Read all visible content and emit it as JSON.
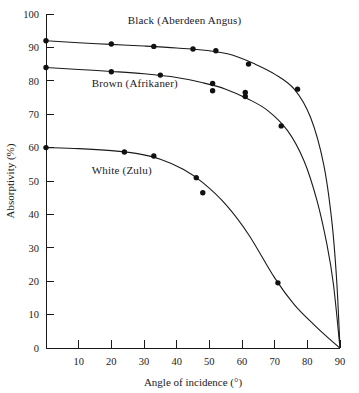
{
  "chart_data": {
    "type": "line",
    "title": "",
    "xlabel": "Angle of incidence (°)",
    "ylabel": "Absorptivity (%)",
    "xlim": [
      0,
      90
    ],
    "ylim": [
      0,
      100
    ],
    "xticks": [
      10,
      20,
      30,
      40,
      50,
      60,
      70,
      80,
      90
    ],
    "yticks": [
      0,
      10,
      20,
      30,
      40,
      50,
      60,
      70,
      80,
      90,
      100
    ],
    "xtick_labels": [
      "10",
      "20",
      "30",
      "40",
      "50",
      "60",
      "70",
      "80",
      "90"
    ],
    "ytick_labels": [
      "0",
      "10",
      "20",
      "30",
      "40",
      "50",
      "60",
      "70",
      "80",
      "90",
      "100"
    ],
    "grid": false,
    "legend_position": "inline-annotations",
    "series": [
      {
        "name": "Black (Aberdeen Angus)",
        "label": "Black (Aberdeen Angus)",
        "color": "#1a1a1a",
        "label_x": 25,
        "label_y": 97,
        "points": [
          {
            "x": 0,
            "y": 92
          },
          {
            "x": 20,
            "y": 91
          },
          {
            "x": 33,
            "y": 90.3
          },
          {
            "x": 45,
            "y": 89.5
          },
          {
            "x": 52,
            "y": 89
          },
          {
            "x": 62,
            "y": 85
          },
          {
            "x": 77,
            "y": 77.5
          }
        ],
        "curve": [
          {
            "x": 0,
            "y": 92
          },
          {
            "x": 10,
            "y": 91.4
          },
          {
            "x": 20,
            "y": 90.9
          },
          {
            "x": 30,
            "y": 90.4
          },
          {
            "x": 40,
            "y": 89.8
          },
          {
            "x": 50,
            "y": 89
          },
          {
            "x": 57,
            "y": 87.7
          },
          {
            "x": 64,
            "y": 85
          },
          {
            "x": 70,
            "y": 82
          },
          {
            "x": 76,
            "y": 77.5
          },
          {
            "x": 81,
            "y": 69
          },
          {
            "x": 85,
            "y": 55
          },
          {
            "x": 87.5,
            "y": 38
          },
          {
            "x": 89,
            "y": 20
          },
          {
            "x": 90,
            "y": 0
          }
        ]
      },
      {
        "name": "Brown (Afrikaner)",
        "label": "Brown (Afrikaner)",
        "color": "#1a1a1a",
        "label_x": 14,
        "label_y": 78,
        "points": [
          {
            "x": 0,
            "y": 84
          },
          {
            "x": 20,
            "y": 82.7
          },
          {
            "x": 35,
            "y": 81.7
          },
          {
            "x": 51,
            "y": 79.2
          },
          {
            "x": 51,
            "y": 77
          },
          {
            "x": 61,
            "y": 76.5
          },
          {
            "x": 61,
            "y": 75.3
          },
          {
            "x": 72,
            "y": 66.5
          }
        ],
        "curve": [
          {
            "x": 0,
            "y": 84
          },
          {
            "x": 10,
            "y": 83.4
          },
          {
            "x": 20,
            "y": 82.8
          },
          {
            "x": 30,
            "y": 82.1
          },
          {
            "x": 40,
            "y": 81
          },
          {
            "x": 48,
            "y": 79.4
          },
          {
            "x": 55,
            "y": 77.5
          },
          {
            "x": 62,
            "y": 74.5
          },
          {
            "x": 68,
            "y": 71
          },
          {
            "x": 74,
            "y": 65
          },
          {
            "x": 79,
            "y": 56
          },
          {
            "x": 83,
            "y": 44
          },
          {
            "x": 86,
            "y": 31
          },
          {
            "x": 88,
            "y": 19
          },
          {
            "x": 90,
            "y": 0
          }
        ]
      },
      {
        "name": "White (Zulu)",
        "label": "White (Zulu)",
        "color": "#1a1a1a",
        "label_x": 14,
        "label_y": 52,
        "points": [
          {
            "x": 0,
            "y": 60
          },
          {
            "x": 24,
            "y": 58.7
          },
          {
            "x": 33,
            "y": 57.5
          },
          {
            "x": 46,
            "y": 51
          },
          {
            "x": 48,
            "y": 46.5
          },
          {
            "x": 71,
            "y": 19.5
          }
        ],
        "curve": [
          {
            "x": 0,
            "y": 60
          },
          {
            "x": 10,
            "y": 59.7
          },
          {
            "x": 20,
            "y": 59.1
          },
          {
            "x": 28,
            "y": 58.2
          },
          {
            "x": 35,
            "y": 56.5
          },
          {
            "x": 42,
            "y": 53.5
          },
          {
            "x": 48,
            "y": 49.5
          },
          {
            "x": 55,
            "y": 43
          },
          {
            "x": 62,
            "y": 34
          },
          {
            "x": 70,
            "y": 21
          },
          {
            "x": 76,
            "y": 13
          },
          {
            "x": 82,
            "y": 7
          },
          {
            "x": 87,
            "y": 2.5
          },
          {
            "x": 90,
            "y": 0
          }
        ]
      }
    ]
  }
}
